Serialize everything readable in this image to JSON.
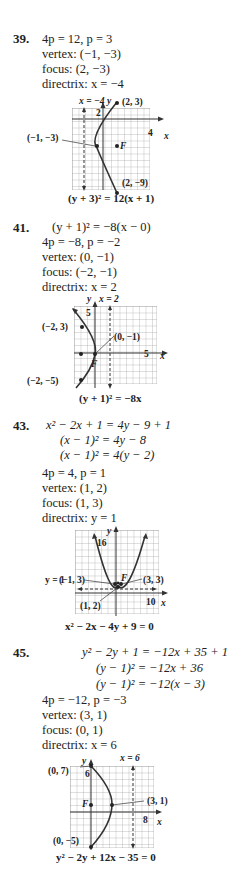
{
  "problems": [
    {
      "number": "39.",
      "lines": [
        "4p = 12, p = 3",
        "vertex: (−1, −3)",
        "focus: (2, −3)",
        "directrix: x = −4"
      ],
      "graph": {
        "directrix_label": "x = −4",
        "y_axis": "y",
        "x_axis": "x",
        "y_tick": "2",
        "x_tick": "4",
        "points": [
          "(2, 3)",
          "(−1, −3)",
          "(2, −9)"
        ],
        "focus_label": "F",
        "equation": "(y + 3)² = 12(x + 1)"
      }
    },
    {
      "number": "41.",
      "lines": [
        "(y + 1)² = −8(x − 0)",
        "4p = −8, p = −2",
        "vertex: (0, −1)",
        "focus: (−2, −1)",
        "directrix: x = 2"
      ],
      "graph": {
        "directrix_label": "x = 2",
        "y_axis": "y",
        "x_axis": "x",
        "y_tick": "5",
        "x_tick": "5",
        "points": [
          "(−2, 3)",
          "(0, −1)",
          "(−2, −5)"
        ],
        "focus_label": "F",
        "equation": "(y + 1)² = −8x"
      }
    },
    {
      "number": "43.",
      "lines": [
        "x² − 2x + 1 = 4y − 9 + 1",
        "(x − 1)² = 4y − 8",
        "(x − 1)² = 4(y − 2)",
        "4p = 4, p = 1",
        "vertex: (1, 2)",
        "focus: (1, 3)",
        "directrix: y = 1"
      ],
      "graph": {
        "directrix_label": "y = 1",
        "y_axis": "y",
        "x_axis": "x",
        "y_tick": "16",
        "x_tick": "10",
        "points": [
          "(−1, 3)",
          "(3, 3)",
          "(1, 2)"
        ],
        "focus_label": "F",
        "equation": "x² − 2x − 4y + 9 = 0"
      }
    },
    {
      "number": "45.",
      "lines": [
        "y² − 2y + 1 = −12x + 35 + 1",
        "(y − 1)² = −12x + 36",
        "(y − 1)² = −12(x − 3)",
        "4p = −12, p = −3",
        "vertex: (3, 1)",
        "focus: (0, 1)",
        "directrix: x = 6"
      ],
      "graph": {
        "directrix_label": "x = 6",
        "y_axis": "y",
        "x_axis": "x",
        "y_tick": "6",
        "x_tick": "8",
        "points": [
          "(0, 7)",
          "(3, 1)",
          "(0, −5)"
        ],
        "focus_label": "F",
        "equation": "y² − 2y + 12x − 35 = 0"
      }
    }
  ]
}
